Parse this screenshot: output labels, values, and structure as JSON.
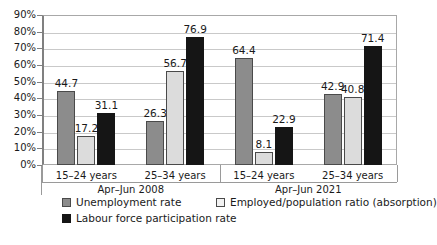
{
  "chart_data": {
    "type": "bar",
    "title": "",
    "subtitle": "",
    "xlabel": "",
    "ylabel": "",
    "ylim": [
      0,
      90
    ],
    "ytick_labels": [
      "0%",
      "10%",
      "20%",
      "30%",
      "40%",
      "50%",
      "60%",
      "70%",
      "80%",
      "90%"
    ],
    "ytick_values": [
      0,
      10,
      20,
      30,
      40,
      50,
      60,
      70,
      80,
      90
    ],
    "grid": true,
    "legend_position": "bottom-left",
    "groups": [
      {
        "label": "Apr–Jun 2008",
        "categories": [
          "15–24 years",
          "25–34 years"
        ],
        "values": [
          [
            44.7,
            17.2,
            31.1
          ],
          [
            26.3,
            56.7,
            76.9
          ]
        ]
      },
      {
        "label": "Apr–Jun 2021",
        "categories": [
          "15–24 years",
          "25–34 years"
        ],
        "values": [
          [
            64.4,
            8.1,
            22.9
          ],
          [
            42.9,
            40.8,
            71.4
          ]
        ]
      }
    ],
    "categories": [
      "15–24 years",
      "25–34 years",
      "15–24 years",
      "25–34 years"
    ],
    "series": [
      {
        "name": "Unemployment rate",
        "color": "#8c8c8c",
        "values": [
          44.7,
          26.3,
          64.4,
          42.9
        ]
      },
      {
        "name": "Employed/population ratio (absorption)",
        "color": "#dcdcdc",
        "values": [
          17.2,
          56.7,
          8.1,
          40.8
        ]
      },
      {
        "name": "Labour force participation rate",
        "color": "#151515",
        "values": [
          31.1,
          76.9,
          22.9,
          71.4
        ]
      }
    ]
  },
  "colors": {
    "series_unemployment": "#8c8c8c",
    "series_absorption": "#dcdcdc",
    "series_participation": "#151515",
    "grid": "#c9c9c9",
    "axis": "#808080",
    "text": "#1a1a1a",
    "background": "#ffffff"
  }
}
